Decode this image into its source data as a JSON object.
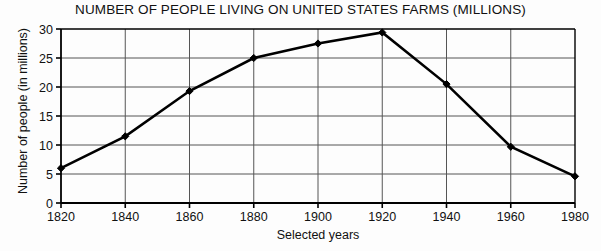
{
  "chart_data": {
    "type": "line",
    "title": "NUMBER OF PEOPLE LIVING ON UNITED STATES FARMS (MILLIONS)",
    "xlabel": "Selected years",
    "ylabel": "Number of people (in millions)",
    "x": [
      1820,
      1840,
      1860,
      1880,
      1900,
      1920,
      1940,
      1960,
      1980
    ],
    "values": [
      6,
      11.5,
      19.3,
      25,
      27.5,
      29.4,
      20.5,
      9.7,
      4.6
    ],
    "series": [
      {
        "name": "People living on U.S. farms",
        "values": [
          6,
          11.5,
          19.3,
          25,
          27.5,
          29.4,
          20.5,
          9.7,
          4.6
        ]
      }
    ],
    "xtick_labels": [
      "1820",
      "1840",
      "1860",
      "1880",
      "1900",
      "1920",
      "1940",
      "1960",
      "1980"
    ],
    "ytick_labels": [
      "0",
      "5",
      "10",
      "15",
      "20",
      "25",
      "30"
    ],
    "yticks": [
      0,
      5,
      10,
      15,
      20,
      25,
      30
    ],
    "xlim": [
      1820,
      1980
    ],
    "ylim": [
      0,
      30
    ],
    "grid": "both",
    "legend": "none",
    "marker": "filled-diamond",
    "line_color": "#000000",
    "grid_color": "#555555",
    "axis_color": "#000000",
    "background_color": "#fdfdfd"
  }
}
